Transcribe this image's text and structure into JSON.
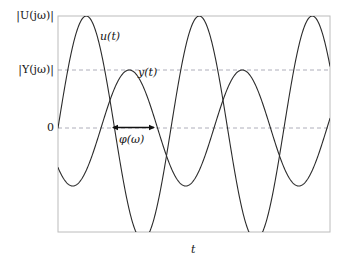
{
  "figure": {
    "kind": "sinusoid-frequency-response-diagram",
    "axis": {
      "x_label": "t",
      "y_ticks": [
        {
          "id": "u-magnitude",
          "label": "|U(jω)|",
          "y_value": 1.0
        },
        {
          "id": "y-magnitude",
          "label": "|Y(jω)|",
          "y_value": 0.5178
        },
        {
          "id": "zero",
          "label": "0",
          "y_value": 0.0
        }
      ]
    },
    "annotations": {
      "phase_label": "φ(ω)",
      "u_curve_label": "u(t)",
      "y_curve_label": "y(t)"
    },
    "colors": {
      "frame": "#b9b9b9",
      "curve": "#2b2b2b",
      "gridline": "#9a9aa8",
      "arrow": "#111111",
      "background": "#ffffff"
    }
  },
  "chart_data": {
    "type": "line",
    "title": "",
    "subtitle": "",
    "xlabel": "t",
    "ylabel": "",
    "grid": false,
    "legend_position": "inline-curve-labels",
    "xlim": [
      0,
      272
    ],
    "ylim": [
      -116,
      116
    ],
    "tick_labels": {
      "y": [
        "|U(jω)|",
        "|Y(jω)|",
        "0"
      ],
      "y_values": [
        112,
        58,
        0
      ],
      "x": []
    },
    "annotations": [
      {
        "type": "double-arrow",
        "label": "φ(ω)",
        "x_start": 54,
        "x_end": 97,
        "y": 0,
        "meaning": "phase lag of y(t) relative to u(t)"
      },
      {
        "type": "curve-label",
        "label": "u(t)",
        "x": 42,
        "y": 92
      },
      {
        "type": "curve-label",
        "label": "y(t)",
        "x": 80,
        "y": 56
      }
    ],
    "series": [
      {
        "name": "u(t)",
        "form": "sine",
        "amplitude": 112,
        "period": 113,
        "phase_shift_px": 0,
        "offset": 0,
        "color": "#2b2b2b"
      },
      {
        "name": "y(t)",
        "form": "sine",
        "amplitude": 58,
        "period": 113,
        "phase_shift_px": 43,
        "offset": 0,
        "color": "#2b2b2b"
      }
    ]
  }
}
